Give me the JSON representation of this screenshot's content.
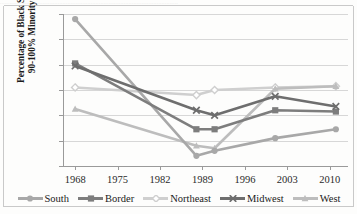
{
  "figure": {
    "scan_artifact_text": "............................................................................................................"
  },
  "chart_data": {
    "type": "line",
    "title": "",
    "xlabel": "",
    "ylabel": "Percentage of Black Students in 90-100% Minority Schools",
    "ylabel_lines": [
      "Percentage of Black Students in",
      "90-100% Minority Schools"
    ],
    "x": [
      1968,
      1988,
      1991,
      2001,
      2011
    ],
    "xticks": [
      1968,
      1975,
      1982,
      1989,
      1996,
      2003,
      2010
    ],
    "xtick_labels": [
      "1968",
      "1975",
      "1982",
      "1989",
      "1996",
      "2003",
      "2010"
    ],
    "yticks": [
      20,
      30,
      40,
      50,
      60,
      70,
      80
    ],
    "ytick_labels": [
      "20",
      "30",
      "40",
      "50",
      "60",
      "70",
      "80"
    ],
    "xlim": [
      1966,
      2013
    ],
    "ylim": [
      20,
      80
    ],
    "grid": "horizontal",
    "legend_position": "bottom",
    "series": [
      {
        "name": "South",
        "color": "#a8a8a8",
        "marker": "circle",
        "values": [
          78.0,
          24.0,
          26.0,
          31.0,
          34.5
        ]
      },
      {
        "name": "Border",
        "color": "#7d7d7d",
        "marker": "square",
        "values": [
          60.5,
          34.5,
          34.5,
          42.0,
          41.5
        ]
      },
      {
        "name": "Northeast",
        "color": "#cfcfcf",
        "marker": "diamond",
        "values": [
          51.0,
          48.0,
          50.0,
          51.0,
          51.5
        ]
      },
      {
        "name": "Midwest",
        "color": "#6e6e6e",
        "marker": "x",
        "values": [
          59.5,
          42.0,
          40.0,
          47.5,
          43.5
        ]
      },
      {
        "name": "West",
        "color": "#bdbdbd",
        "marker": "triangle",
        "values": [
          42.5,
          28.0,
          27.0,
          50.5,
          51.5
        ]
      }
    ]
  }
}
